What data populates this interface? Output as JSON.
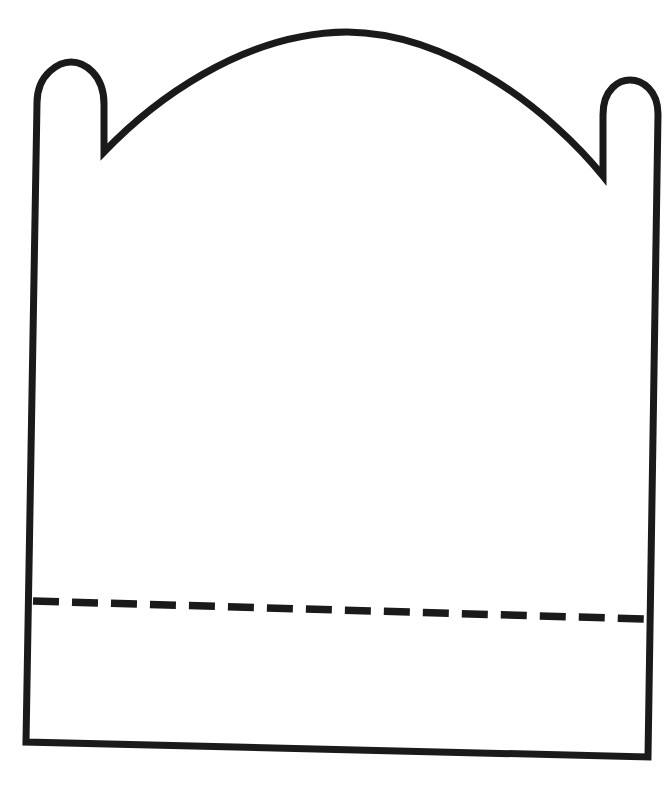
{
  "document": {
    "title": "Blank Outline Line Drawing",
    "kind": "line-art-coloring-page",
    "canvas": {
      "width": 672,
      "height": 788,
      "background_color": "#ffffff"
    }
  },
  "artwork": {
    "name": "arched-plaque-outline",
    "description": "Single closed black outline of an arched plaque / tabbed banner shape with two rounded tabs at the upper corners, a wide domed arch spanning between them, slightly tapered vertical sides, a straight bottom edge, and a horizontal dashed fold line near the bottom.",
    "stroke_color": "#1a1a1a",
    "fill_color": "#ffffff",
    "stroke_width": 7,
    "shapes": [
      {
        "id": "body-outline",
        "label": "plaque-outline",
        "type": "closed-path",
        "path": "M 37 103 C 37 73 60 62 71 62 C 84 62 104 74 104 104 L 104 152 C 150 104 240 33 347 32 C 452 33 552 113 603 176 L 603 115 C 603 88 620 80 630 80 C 642 80 658 90 658 114 L 648 757 L 26 742 Z"
      },
      {
        "id": "fold-line",
        "label": "dashed-fold-line",
        "type": "dashed-line",
        "x1": 33,
        "y1": 601,
        "x2": 644,
        "y2": 619,
        "dash_length": 26,
        "gap_length": 13,
        "stroke_width": 7.5
      }
    ],
    "anchors": {
      "arch_apex": {
        "x": 347,
        "y": 32
      },
      "left_tab_top": {
        "x": 71,
        "y": 62
      },
      "right_tab_top": {
        "x": 630,
        "y": 80
      },
      "left_notch": {
        "x": 104,
        "y": 152
      },
      "right_notch": {
        "x": 603,
        "y": 176
      },
      "bottom_left_corner": {
        "x": 26,
        "y": 742
      },
      "bottom_right_corner": {
        "x": 648,
        "y": 757
      }
    }
  }
}
